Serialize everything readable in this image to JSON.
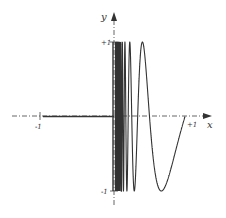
{
  "chart_data": {
    "type": "line",
    "title": "",
    "function": "y = sin(pi/x) for 0 < x <= 1; y = 0 for -1 <= x < 0; vertical segment at x = 0 from -1 to +1",
    "xlabel": "x",
    "ylabel": "y",
    "xlim": [
      -1,
      1
    ],
    "ylim": [
      -1,
      1
    ],
    "x_ticks": [
      "-1",
      "+1"
    ],
    "y_ticks": [
      "+1",
      "-1"
    ],
    "grid": false,
    "legend": null,
    "series": [
      {
        "name": "negative-branch",
        "x": [
          -1,
          0
        ],
        "y": [
          0,
          0
        ]
      },
      {
        "name": "limit-segment",
        "x": [
          0,
          0
        ],
        "y": [
          -1,
          1
        ]
      },
      {
        "name": "oscillating-branch",
        "expression": "sin(pi/x)",
        "x_range": [
          0.02,
          1
        ],
        "key_points": [
          {
            "x": 0.4,
            "y": 1
          },
          {
            "x": 0.5,
            "y": 0
          },
          {
            "x": 0.667,
            "y": -1
          },
          {
            "x": 1,
            "y": 0
          }
        ]
      }
    ]
  },
  "labels": {
    "x_axis": "x",
    "y_axis": "y",
    "x_neg": "-1",
    "x_pos": "+1",
    "y_pos": "+1",
    "y_neg": "-1"
  },
  "colors": {
    "curve": "#333333",
    "axis": "#555555"
  }
}
